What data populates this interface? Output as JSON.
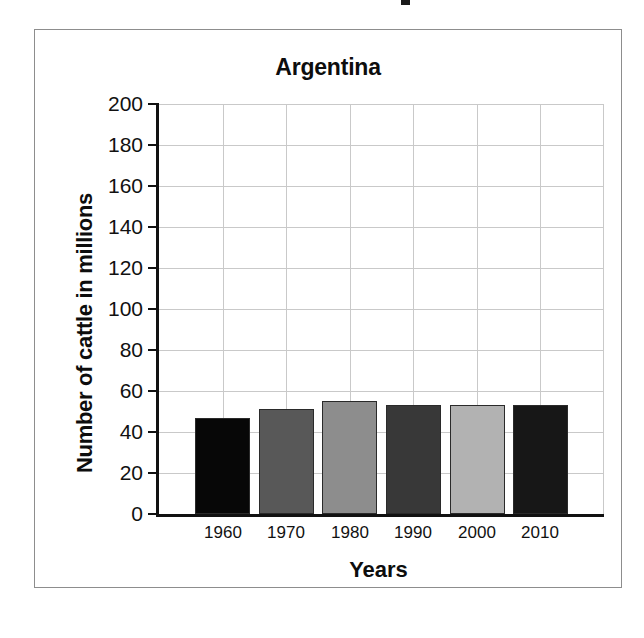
{
  "figure": {
    "background_color": "#ffffff",
    "frame_color": "#8d8d8d"
  },
  "chart_data": {
    "type": "bar",
    "title": "Argentina",
    "xlabel": "Years",
    "ylabel": "Number of cattle in millions",
    "categories": [
      "1960",
      "1970",
      "1980",
      "1990",
      "2000",
      "2010"
    ],
    "values": [
      47,
      51,
      55,
      53,
      53,
      53
    ],
    "series": [
      {
        "name": "Number of cattle in millions",
        "values": [
          47,
          51,
          55,
          53,
          53,
          53
        ]
      }
    ],
    "ylim": [
      0,
      200
    ],
    "ytick_labels": [
      "200",
      "180",
      "160",
      "140",
      "120",
      "100",
      "80",
      "60",
      "40",
      "20",
      "0"
    ],
    "ytick_values": [
      200,
      180,
      160,
      140,
      120,
      100,
      80,
      60,
      40,
      20,
      0
    ],
    "ytick_step": 20,
    "grid": true,
    "grid_color": "#c9c9c9",
    "legend": null,
    "bar_colors": [
      "#070707",
      "#585858",
      "#8d8d8d",
      "#383838",
      "#b2b2b2",
      "#171717"
    ],
    "bar_border_color": "#2a2a2a",
    "axis_color": "#111111"
  }
}
